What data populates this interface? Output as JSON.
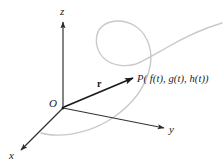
{
  "figure": {
    "type": "3d-coordinate-diagram",
    "width": 223,
    "height": 166,
    "background_color": "#ffffff"
  },
  "axes": {
    "z": {
      "label": "z",
      "direction": "up",
      "color": "#333333"
    },
    "y": {
      "label": "y",
      "direction": "right-down",
      "color": "#333333"
    },
    "x": {
      "label": "x",
      "direction": "left-down",
      "color": "#333333"
    }
  },
  "origin": {
    "label": "O",
    "color": "#1a1a1a"
  },
  "vector": {
    "label": "r",
    "style": "bold-italic-arrow",
    "color": "#1a1a1a"
  },
  "point": {
    "label": "P( f(t), g(t), h(t))",
    "color": "#1a1a1a"
  },
  "curve": {
    "name": "space-curve",
    "color": "#c9c9c9",
    "stroke_width": 1.4,
    "shape": "loop-with-two-tails"
  }
}
